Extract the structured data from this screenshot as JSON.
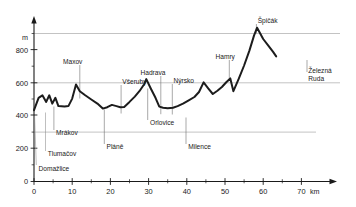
{
  "chart_data": {
    "type": "line",
    "title": "",
    "subtitle": "",
    "xlabel": "km",
    "ylabel": "m",
    "xlim": [
      0,
      72
    ],
    "ylim": [
      0,
      1000
    ],
    "grid": true,
    "gridlines_y": [
      300,
      600,
      900
    ],
    "legend": "none",
    "x_ticks_major": [
      0,
      10,
      20,
      30,
      40,
      50,
      60,
      70
    ],
    "x_ticks_minor": [
      5,
      15,
      25,
      35,
      45,
      55,
      65
    ],
    "x_tick_labels": [
      "0",
      "10",
      "20",
      "30",
      "40",
      "50",
      "60",
      "70"
    ],
    "y_ticks_major": [
      0,
      200,
      400,
      600,
      800
    ],
    "y_ticks_minor": [
      100,
      300,
      500,
      700,
      900
    ],
    "y_tick_labels": [
      "0",
      "200",
      "400",
      "600",
      "800"
    ],
    "series": [
      {
        "name": "elevation-profile",
        "x": [
          0.0,
          1.2,
          2.2,
          3.2,
          4.0,
          4.8,
          5.6,
          6.4,
          8.0,
          9.0,
          10.0,
          11.0,
          12.0,
          13.4,
          15.0,
          16.6,
          18.0,
          19.2,
          20.4,
          21.6,
          22.6,
          23.6,
          25.0,
          26.4,
          27.6,
          28.8,
          29.4,
          30.6,
          31.8,
          32.8,
          33.8,
          35.0,
          36.4,
          37.6,
          39.0,
          40.4,
          42.0,
          43.2,
          44.4,
          45.6,
          46.8,
          48.0,
          49.2,
          50.4,
          51.4,
          52.2,
          53.6,
          55.0,
          56.4,
          57.6,
          58.4,
          60.0,
          61.4,
          62.6,
          63.4
        ],
        "y": [
          430,
          505,
          520,
          480,
          520,
          470,
          505,
          455,
          452,
          455,
          500,
          585,
          545,
          520,
          495,
          470,
          440,
          448,
          462,
          455,
          448,
          450,
          480,
          512,
          545,
          585,
          618,
          560,
          505,
          452,
          445,
          442,
          445,
          455,
          470,
          488,
          510,
          540,
          598,
          562,
          528,
          548,
          570,
          600,
          622,
          545,
          620,
          700,
          790,
          880,
          928,
          860,
          818,
          782,
          755
        ]
      }
    ],
    "annotations": [
      {
        "label": "Domažlice",
        "x_km": 0.6,
        "text_anchor": "start"
      },
      {
        "label": "Tlumačov",
        "x_km": 3.0,
        "text_anchor": "start"
      },
      {
        "label": "Mrákov",
        "x_km": 5.2,
        "text_anchor": "start"
      },
      {
        "label": "Maxov",
        "x_km": 12.0,
        "text_anchor": "start"
      },
      {
        "label": "Pláně",
        "x_km": 18.4,
        "text_anchor": "start"
      },
      {
        "label": "Všeruby",
        "x_km": 22.8,
        "text_anchor": "start"
      },
      {
        "label": "Hadrava",
        "x_km": 33.2,
        "text_anchor": "start"
      },
      {
        "label": "Orlovice",
        "x_km": 29.6,
        "text_anchor": "start"
      },
      {
        "label": "Milence",
        "x_km": 39.8,
        "text_anchor": "start"
      },
      {
        "label": "Nýrsko",
        "x_km": 36.2,
        "text_anchor": "start"
      },
      {
        "label": "Hamry",
        "x_km": 51.4,
        "text_anchor": "start"
      },
      {
        "label": "Špičák",
        "x_km": 58.4,
        "text_anchor": "start"
      },
      {
        "label": "Železná",
        "x_km": 63.4,
        "text_anchor": "start"
      },
      {
        "label": "Ruda",
        "x_km": 63.4,
        "text_anchor": "start"
      }
    ]
  },
  "axes": {
    "y_unit": "m",
    "x_unit": "km"
  },
  "labels": {
    "domazlice": "Domažlice",
    "tlumacov": "Tlumačov",
    "mrakov": "Mrákov",
    "maxov": "Maxov",
    "plane": "Pláně",
    "vseruby": "Všeruby",
    "hadrava": "Hadrava",
    "orlovice": "Orlovice",
    "milence": "Milence",
    "nyrsko": "Nýrsko",
    "hamry": "Hamry",
    "spicak": "Špičák",
    "zelezna": "Železná",
    "ruda": "Ruda"
  },
  "ticks": {
    "x0": "0",
    "x10": "10",
    "x20": "20",
    "x30": "30",
    "x40": "40",
    "x50": "50",
    "x60": "60",
    "x70": "70",
    "y0": "0",
    "y200": "200",
    "y400": "400",
    "y600": "600",
    "y800": "800"
  },
  "colors": {
    "profile_stroke": "#1c1c1c",
    "grid": "#9a9a9a",
    "axis": "#1a1a1a",
    "background": "#ffffff"
  }
}
